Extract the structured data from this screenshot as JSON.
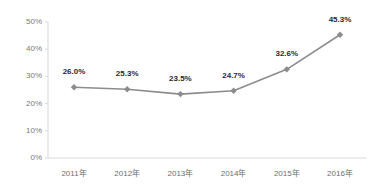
{
  "chart_data": {
    "type": "line",
    "title": "",
    "subtitle": "",
    "xlabel": "",
    "ylabel": "",
    "categories": [
      "2011年",
      "2012年",
      "2013年",
      "2014年",
      "2015年",
      "2016年"
    ],
    "values": [
      26.0,
      25.3,
      23.5,
      24.7,
      32.6,
      45.3
    ],
    "data_labels": [
      "26.0%",
      "25.3%",
      "23.5%",
      "24.7%",
      "32.6%",
      "45.3%"
    ],
    "ylim": [
      0,
      50
    ],
    "yticks": [
      0,
      10,
      20,
      30,
      40,
      50
    ],
    "ytick_labels": [
      "0%",
      "10%",
      "20%",
      "30%",
      "40%",
      "50%"
    ],
    "grid": false,
    "legend": null,
    "legend_position": "none",
    "series": [
      {
        "name": "",
        "values": [
          26.0,
          25.3,
          23.5,
          24.7,
          32.6,
          45.3
        ],
        "line_color": "#8c8c8c",
        "marker": "diamond",
        "marker_color": "#8c8c8c"
      }
    ],
    "colors": {
      "line": "#8c8c8c",
      "marker": "#8c8c8c",
      "axis": "#d9d9d9",
      "tick_text": "#7a7a7a",
      "label_text": "#2b2b2b",
      "background": "#ffffff"
    },
    "annotations": []
  }
}
